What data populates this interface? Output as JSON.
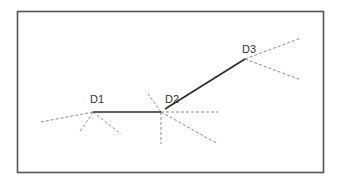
{
  "diagram": {
    "type": "path-with-rays",
    "colors": {
      "frame": "#555555",
      "path": "#2a2a2a",
      "rays": "#8a8a8a",
      "label": "#333333"
    },
    "nodes": [
      {
        "id": "D1",
        "label": "D1"
      },
      {
        "id": "D2",
        "label": "D2"
      },
      {
        "id": "D3",
        "label": "D3"
      }
    ],
    "edges": [
      {
        "from": "D1",
        "to": "D2",
        "style": "solid"
      },
      {
        "from": "D2",
        "to": "D3",
        "style": "solid"
      }
    ],
    "rays": [
      {
        "node": "D1",
        "direction": "left",
        "style": "dashed"
      },
      {
        "node": "D1",
        "direction": "down-left",
        "style": "dashed"
      },
      {
        "node": "D1",
        "direction": "down-right",
        "style": "dashed"
      },
      {
        "node": "D2",
        "direction": "up-left",
        "style": "dashed"
      },
      {
        "node": "D2",
        "direction": "right",
        "style": "dashed"
      },
      {
        "node": "D2",
        "direction": "down",
        "style": "dashed"
      },
      {
        "node": "D2",
        "direction": "down-right",
        "style": "dashed"
      },
      {
        "node": "D3",
        "direction": "up-right",
        "style": "dashed"
      },
      {
        "node": "D3",
        "direction": "down-right",
        "style": "dashed"
      }
    ]
  }
}
